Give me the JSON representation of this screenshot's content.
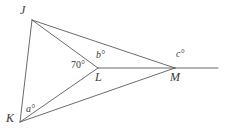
{
  "figure": {
    "width": 225,
    "height": 139,
    "background_color": "#ffffff",
    "line_color": "#5a5a5a",
    "text_color": "#3a3a3a"
  },
  "vertices": [
    {
      "id": "J",
      "label": "J",
      "x": 32,
      "y": 20,
      "label_x": 20,
      "label_y": 4
    },
    {
      "id": "K",
      "label": "K",
      "x": 20,
      "y": 122,
      "label_x": 6,
      "label_y": 112
    },
    {
      "id": "L",
      "label": "L",
      "x": 98,
      "y": 68,
      "label_x": 95,
      "label_y": 71
    },
    {
      "id": "M",
      "label": "M",
      "x": 175,
      "y": 68,
      "label_x": 170,
      "label_y": 71
    }
  ],
  "segments": [
    {
      "id": "JK",
      "from": "J",
      "to": "K",
      "x1": 32,
      "y1": 20,
      "x2": 20,
      "y2": 122
    },
    {
      "id": "JL",
      "from": "J",
      "to": "L",
      "x1": 32,
      "y1": 20,
      "x2": 98,
      "y2": 68
    },
    {
      "id": "JM",
      "from": "J",
      "to": "M",
      "x1": 32,
      "y1": 20,
      "x2": 175,
      "y2": 68
    },
    {
      "id": "KL",
      "from": "K",
      "to": "L",
      "x1": 20,
      "y1": 122,
      "x2": 98,
      "y2": 68
    },
    {
      "id": "KM",
      "from": "K",
      "to": "M",
      "x1": 20,
      "y1": 122,
      "x2": 175,
      "y2": 68
    },
    {
      "id": "LM",
      "from": "L",
      "to": "M",
      "x1": 98,
      "y1": 68,
      "x2": 175,
      "y2": 68
    },
    {
      "id": "M-ray",
      "from": "M",
      "to": "ray-end",
      "x1": 175,
      "y1": 68,
      "x2": 218,
      "y2": 68
    }
  ],
  "angles": [
    {
      "id": "angle-a",
      "label": "a°",
      "at_vertex": "K",
      "x": 26,
      "y": 104,
      "style": "italic"
    },
    {
      "id": "angle-70",
      "label": "70°",
      "at_vertex": "L",
      "x": 71,
      "y": 60,
      "style": "upright"
    },
    {
      "id": "angle-b",
      "label": "b°",
      "at_vertex": "L",
      "x": 96,
      "y": 50,
      "style": "italic"
    },
    {
      "id": "angle-c",
      "label": "c°",
      "at_vertex": "M",
      "x": 176,
      "y": 49,
      "style": "italic"
    }
  ]
}
